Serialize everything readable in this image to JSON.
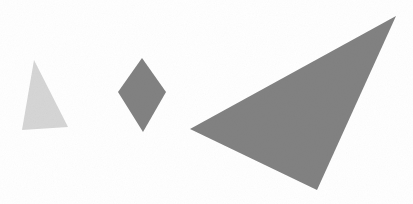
{
  "canvas": {
    "width": 413,
    "height": 204,
    "background_color": "#ffffff",
    "title": "Geometric Shapes"
  },
  "palette": {
    "light_gray": "#d6d6d6",
    "medium_gray": "#828282",
    "background": "#ffffff"
  },
  "shapes": [
    {
      "id": "small-light-triangle",
      "kind": "triangle",
      "label": "Small light gray triangle",
      "fill": "#d6d6d6",
      "points": "34,60 68,127 22,130",
      "vertices": [
        [
          34,
          60
        ],
        [
          68,
          127
        ],
        [
          22,
          130
        ]
      ],
      "bbox": [
        22,
        60,
        46,
        70
      ],
      "size_rank": "small",
      "shade": "light"
    },
    {
      "id": "medium-gray-diamond",
      "kind": "diamond",
      "label": "Medium gray diamond (rhombus)",
      "fill": "#828282",
      "points": "142,58 166,92 143,132 118,92",
      "vertices": [
        [
          142,
          58
        ],
        [
          166,
          92
        ],
        [
          143,
          132
        ],
        [
          118,
          92
        ]
      ],
      "bbox": [
        118,
        58,
        48,
        74
      ],
      "size_rank": "medium",
      "shade": "dark"
    },
    {
      "id": "large-gray-triangle",
      "kind": "triangle",
      "label": "Large gray scalene triangle",
      "fill": "#828282",
      "points": "396,16 317,190 190,129",
      "vertices": [
        [
          396,
          16
        ],
        [
          317,
          190
        ],
        [
          190,
          129
        ]
      ],
      "bbox": [
        190,
        16,
        206,
        174
      ],
      "size_rank": "large",
      "shade": "dark"
    }
  ],
  "counts": {
    "total_shapes": 3,
    "triangles": 2,
    "diamonds": 1
  }
}
